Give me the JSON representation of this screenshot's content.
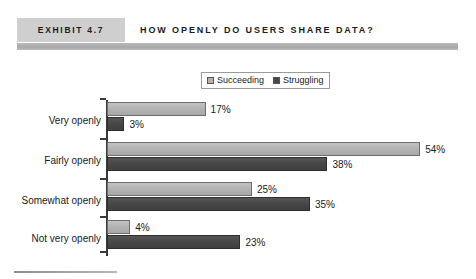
{
  "header": {
    "exhibit_tag": "EXHIBIT 4.7",
    "title": "HOW OPENLY DO USERS SHARE DATA?"
  },
  "legend": {
    "position": "top-center",
    "entries": [
      {
        "label": "Succeeding",
        "color": "#b2b2b2",
        "swatch": "light-gray-square"
      },
      {
        "label": "Struggling",
        "color": "#474747",
        "swatch": "dark-gray-square"
      }
    ]
  },
  "chart_data": {
    "type": "bar",
    "orientation": "horizontal",
    "title": "HOW OPENLY DO USERS SHARE DATA?",
    "xlabel": "",
    "ylabel": "",
    "grid": false,
    "legend_position": "top-center",
    "xlim": [
      0,
      54
    ],
    "categories": [
      "Very openly",
      "Fairly openly",
      "Somewhat openly",
      "Not very openly"
    ],
    "series": [
      {
        "name": "Succeeding",
        "color": "#b2b2b2",
        "values": [
          17,
          54,
          25,
          4
        ],
        "labels": [
          "17%",
          "54%",
          "25%",
          "4%"
        ]
      },
      {
        "name": "Struggling",
        "color": "#474747",
        "values": [
          3,
          38,
          35,
          23
        ],
        "labels": [
          "3%",
          "38%",
          "35%",
          "23%"
        ]
      }
    ]
  },
  "scale": {
    "px_per_percent": 5.8,
    "axis_x": 107
  }
}
